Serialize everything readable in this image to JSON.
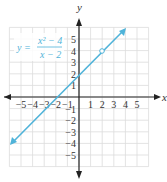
{
  "chart_data": {
    "type": "line",
    "title": "",
    "equation": {
      "lhs": "y =",
      "numerator": "x² − 4",
      "denominator": "x − 2"
    },
    "xlabel": "x",
    "ylabel": "y",
    "xlim": [
      -6,
      6
    ],
    "ylim": [
      -6,
      6
    ],
    "grid": true,
    "x_ticks": [
      "−5",
      "−4",
      "−3",
      "−2",
      "−1",
      "1",
      "2",
      "3",
      "4",
      "5"
    ],
    "y_ticks": [
      "5",
      "4",
      "3",
      "2",
      "1",
      "−1",
      "−2",
      "−3",
      "−4",
      "−5"
    ],
    "series": [
      {
        "name": "y = (x²−4)/(x−2)",
        "x": [
          -6,
          4
        ],
        "y": [
          -4,
          6
        ],
        "color": "#4fb3d9",
        "hole": {
          "x": 2,
          "y": 4
        },
        "arrows": "both"
      }
    ]
  },
  "colors": {
    "line": "#4fb3d9",
    "grid": "#dcdcdc",
    "axis": "#222222"
  }
}
